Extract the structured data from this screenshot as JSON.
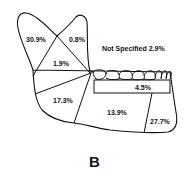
{
  "figure": {
    "panel_label": "B",
    "not_specified": "Not Specified 2.9%",
    "regions": [
      {
        "name": "condyle",
        "label": "30.9%"
      },
      {
        "name": "coronoid",
        "label": "0.8%"
      },
      {
        "name": "ramus",
        "label": "1.9%"
      },
      {
        "name": "angle",
        "label": "17.3%"
      },
      {
        "name": "body",
        "label": "13.9%"
      },
      {
        "name": "alveolar",
        "label": "4.5%"
      },
      {
        "name": "symphysis-parasymphysis",
        "label": "27.7%"
      }
    ]
  },
  "colors": {
    "stroke": "#111111",
    "background": "#ffffff"
  }
}
